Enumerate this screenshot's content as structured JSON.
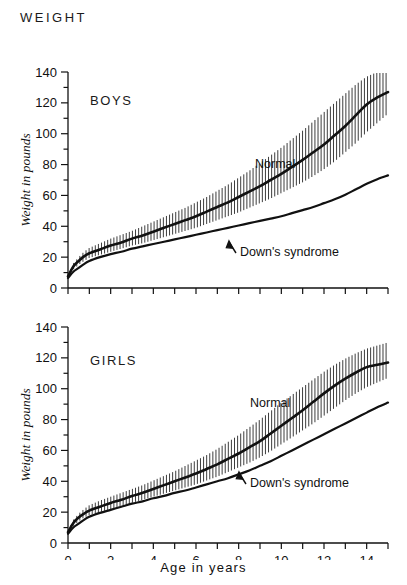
{
  "title": "WEIGHT",
  "axis": {
    "y_label": "Weight in pounds",
    "x_label": "Age in years",
    "y_ticks": [
      "0",
      "20",
      "40",
      "60",
      "80",
      "100",
      "120",
      "140"
    ],
    "x_ticks": [
      "0",
      "2",
      "4",
      "6",
      "8",
      "10",
      "12",
      "14"
    ]
  },
  "panels": {
    "boys": {
      "label": "BOYS",
      "normal_label": "Normal",
      "downs_label": "Down's syndrome"
    },
    "girls": {
      "label": "GIRLS",
      "normal_label": "Normal",
      "downs_label": "Down's syndrome"
    }
  },
  "colors": {
    "ink": "#111111",
    "background": "#ffffff",
    "hatch": "#1a1a1a"
  },
  "chart_data": {
    "type": "line",
    "title": "WEIGHT",
    "xlabel": "Age in years",
    "ylabel": "Weight in pounds",
    "xlim": [
      0,
      15
    ],
    "ylim": [
      0,
      140
    ],
    "xticks": [
      0,
      1,
      2,
      3,
      4,
      5,
      6,
      7,
      8,
      9,
      10,
      11,
      12,
      13,
      14,
      15
    ],
    "xtick_labels": [
      "0",
      "",
      "2",
      "",
      "4",
      "",
      "6",
      "",
      "8",
      "",
      "10",
      "",
      "12",
      "",
      "14",
      ""
    ],
    "yticks": [
      0,
      10,
      20,
      30,
      40,
      50,
      60,
      70,
      80,
      90,
      100,
      110,
      120,
      130,
      140
    ],
    "ytick_labels": [
      "0",
      "",
      "20",
      "",
      "40",
      "",
      "60",
      "",
      "80",
      "",
      "100",
      "",
      "120",
      "",
      "140"
    ],
    "grid": false,
    "legend": "annotations-inline",
    "panels": [
      {
        "name": "BOYS",
        "x": [
          0,
          0.25,
          0.5,
          0.75,
          1,
          1.5,
          2,
          2.5,
          3,
          3.5,
          4,
          4.5,
          5,
          5.5,
          6,
          6.5,
          7,
          7.5,
          8,
          8.5,
          9,
          9.5,
          10,
          10.5,
          11,
          11.5,
          12,
          12.5,
          13,
          13.5,
          14,
          14.5,
          15
        ],
        "series": [
          {
            "name": "Normal",
            "type": "mean-with-range-band",
            "values": [
              7.5,
              14,
              17.5,
              20.5,
              22.5,
              25,
              27.5,
              29.5,
              32,
              34,
              36.5,
              39,
              41.5,
              44,
              46.5,
              49.5,
              52.5,
              55.5,
              59,
              62.5,
              66,
              70,
              74,
              78.5,
              83,
              88,
              93,
              99,
              105,
              112,
              119,
              123.5,
              127
            ],
            "band_low": [
              6.5,
              12,
              15,
              17.5,
              19.5,
              21.5,
              23.5,
              25.5,
              27.5,
              29,
              31,
              33,
              35,
              37,
              39,
              41.5,
              44,
              46.5,
              49,
              52,
              55,
              58,
              61.5,
              65,
              68.5,
              72.5,
              77,
              82,
              88,
              94,
              101,
              107,
              113
            ],
            "band_high": [
              8.5,
              16,
              20,
              23.5,
              26,
              29,
              32,
              34.5,
              37,
              40,
              43,
              46,
              49,
              52,
              55.5,
              59,
              63,
              67,
              71.5,
              76,
              81,
              86,
              91,
              96.5,
              102,
              108,
              114,
              120,
              126,
              132,
              137,
              140,
              141
            ]
          },
          {
            "name": "Down's syndrome",
            "type": "mean",
            "values": [
              6.5,
              10.5,
              13,
              15.5,
              17.5,
              20,
              22,
              23.5,
              25.5,
              27,
              28.5,
              30,
              31.5,
              33,
              34.5,
              36,
              37.5,
              39,
              40.5,
              42,
              43.5,
              45,
              46.5,
              48.5,
              50.5,
              52.5,
              55,
              57.5,
              60.5,
              64,
              67.5,
              70.5,
              73
            ]
          }
        ],
        "annotations": [
          {
            "text": "BOYS",
            "x": 1.2,
            "y": 118
          },
          {
            "text": "Normal",
            "x": 9.2,
            "y": 97
          },
          {
            "text": "Down's syndrome",
            "x": 8.6,
            "y": 33,
            "arrow": "up-left"
          }
        ]
      },
      {
        "name": "GIRLS",
        "x": [
          0,
          0.25,
          0.5,
          0.75,
          1,
          1.5,
          2,
          2.5,
          3,
          3.5,
          4,
          4.5,
          5,
          5.5,
          6,
          6.5,
          7,
          7.5,
          8,
          8.5,
          9,
          9.5,
          10,
          10.5,
          11,
          11.5,
          12,
          12.5,
          13,
          13.5,
          14,
          14.5,
          15
        ],
        "series": [
          {
            "name": "Normal",
            "type": "mean-with-range-band",
            "values": [
              7,
              13,
              16.5,
              19,
              21,
              23.5,
              26,
              28,
              30.5,
              32.5,
              35,
              37.5,
              40,
              42.5,
              45,
              48,
              51,
              54.5,
              58,
              62,
              66,
              71,
              76,
              81,
              86,
              91.5,
              97,
              102,
              106.5,
              110.5,
              114,
              115.5,
              117
            ],
            "band_low": [
              6,
              11,
              14,
              16.5,
              18,
              20,
              22,
              24,
              26,
              28,
              30,
              32,
              34,
              36,
              38,
              40.5,
              43,
              46,
              49,
              52,
              55.5,
              59.5,
              64,
              68.5,
              73,
              77.5,
              82.5,
              87.5,
              92.5,
              97,
              101,
              104,
              107
            ],
            "band_high": [
              8,
              15,
              19,
              22,
              24.5,
              27.5,
              30,
              32.5,
              35,
              37.5,
              40.5,
              43.5,
              46.5,
              50,
              53.5,
              57,
              61,
              65.5,
              70,
              75,
              80,
              85.5,
              91,
              96,
              101,
              106,
              111,
              115.5,
              119.5,
              123,
              126,
              128,
              130
            ]
          },
          {
            "name": "Down's syndrome",
            "type": "mean",
            "values": [
              6,
              10,
              12.5,
              15,
              17,
              19.5,
              21.5,
              23.5,
              25.5,
              27,
              29,
              30.5,
              32.5,
              34,
              36,
              38,
              40,
              42,
              44.5,
              47,
              50,
              53,
              56.5,
              60,
              63.5,
              67,
              70.5,
              74,
              77.5,
              81,
              84.5,
              88,
              91
            ]
          }
        ],
        "annotations": [
          {
            "text": "GIRLS",
            "x": 1.2,
            "y": 118
          },
          {
            "text": "Normal",
            "x": 9.0,
            "y": 93
          },
          {
            "text": "Down's syndrome",
            "x": 9.0,
            "y": 35,
            "arrow": "up-left"
          }
        ]
      }
    ]
  }
}
